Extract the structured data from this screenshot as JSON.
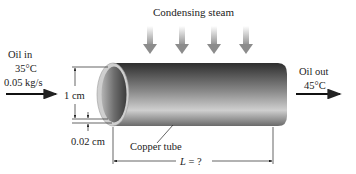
{
  "title": "Condensing steam",
  "inlet": {
    "label": "Oil in",
    "temperature": "35°C",
    "flow_rate": "0.05 kg/s"
  },
  "outlet": {
    "label": "Oil out",
    "temperature": "45°C"
  },
  "dimensions": {
    "diameter": "1 cm",
    "thickness": "0.02 cm",
    "length_var": "L",
    "length_value": " = ?"
  },
  "tube_label": "Copper tube",
  "colors": {
    "tube_dark": "#3a3a3a",
    "tube_light": "#d9d9d9",
    "rim": "#c8c8c8",
    "steam_arrow": "#9a9a9a",
    "line": "#222222"
  }
}
